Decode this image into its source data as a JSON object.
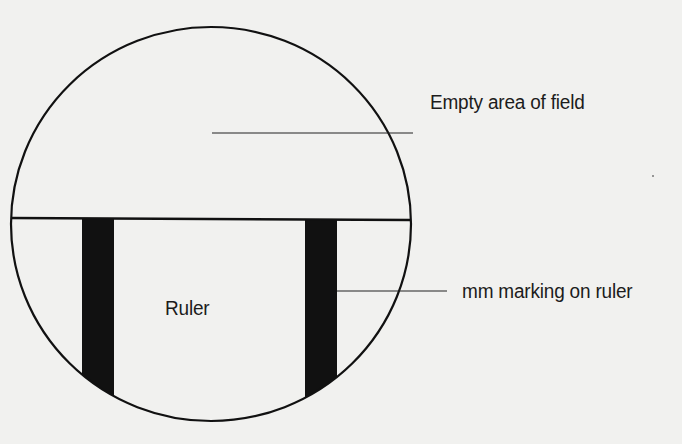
{
  "diagram": {
    "type": "microscope field of view with ruler",
    "labels": {
      "empty_area": "Empty area of field",
      "mm_marking": "mm marking on ruler",
      "ruler": "Ruler"
    },
    "colors": {
      "background": "#f1f1ef",
      "stroke": "#111111",
      "marking_fill": "#111111",
      "text": "#1c1c1c"
    },
    "field_of_view": {
      "shape": "circle",
      "center": [
        211,
        224
      ],
      "radius_x": 200,
      "radius_y": 197
    },
    "ruler_edge_y": 219,
    "mm_markings": [
      {
        "x_left": 82,
        "x_right": 114
      },
      {
        "x_left": 305,
        "x_right": 337
      }
    ],
    "leaders": [
      {
        "target": "empty_area",
        "from": [
          212,
          133
        ],
        "to": [
          413,
          133
        ]
      },
      {
        "target": "mm_marking",
        "from": [
          337,
          291
        ],
        "to": [
          447,
          291
        ]
      }
    ]
  }
}
